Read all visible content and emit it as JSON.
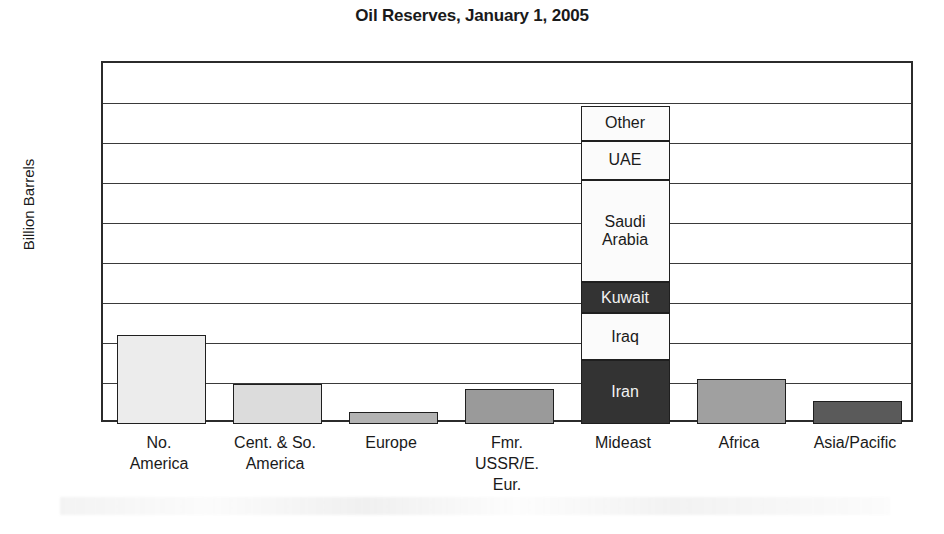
{
  "chart_data": {
    "type": "bar",
    "title": "Oil Reserves, January 1, 2005",
    "xlabel": "",
    "ylabel": "Billion Barrels",
    "ylim": [
      0,
      900
    ],
    "ytick_step": 100,
    "yticks": [
      "900",
      "800",
      "700",
      "600",
      "500",
      "400",
      "300",
      "200",
      "100",
      "0"
    ],
    "grid": true,
    "legend": "none",
    "categories": [
      "No.\nAmerica",
      "Cent. & So.\nAmerica",
      "Europe",
      "Fmr.\nUSSR/E.\nEur.",
      "Mideast",
      "Africa",
      "Asia/Pacific"
    ],
    "values": [
      222,
      100,
      29,
      88,
      800,
      112,
      57
    ],
    "stacked_category": "Mideast",
    "stack_segments": [
      {
        "label": "Iran",
        "value": 159,
        "fill": "#333333",
        "text": "light"
      },
      {
        "label": "Iraq",
        "value": 117,
        "fill": "#fbfbfb",
        "text": "dark"
      },
      {
        "label": "Kuwait",
        "value": 78,
        "fill": "#333333",
        "text": "light"
      },
      {
        "label": "Saudi\nArabia",
        "value": 254,
        "fill": "#fbfbfb",
        "text": "dark"
      },
      {
        "label": "UAE",
        "value": 98,
        "fill": "#fbfbfb",
        "text": "dark"
      },
      {
        "label": "Other",
        "value": 88,
        "fill": "#fbfbfb",
        "text": "dark"
      }
    ],
    "bar_fills": [
      "#ececec",
      "#dcdcdc",
      "#b3b3b3",
      "#9a9a9a",
      "stacked",
      "#a0a0a0",
      "#5a5a5a"
    ]
  },
  "colors": {
    "axis": "#2b2b2b",
    "grid": "#3a3a3a",
    "text": "#1a1a1a",
    "background": "#ffffff"
  }
}
